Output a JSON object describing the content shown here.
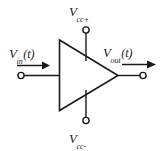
{
  "diagram": {
    "type": "circuit-schematic",
    "background_color": "#ffffff",
    "line_color": "#1a1a1a",
    "labels": {
      "input": {
        "symbol": "V",
        "subscript": "in",
        "argument": "(t)",
        "full": "V_in(t)"
      },
      "output": {
        "symbol": "V",
        "subscript": "out",
        "argument": "(t)",
        "full": "V_out(t)"
      },
      "supply_positive": {
        "symbol": "V",
        "subscript": "cc+",
        "full": "V_cc+"
      },
      "supply_negative": {
        "symbol": "V",
        "subscript": "cc-",
        "full": "V_cc-"
      }
    },
    "elements": {
      "amplifier_triangle": "triangle-amplifier",
      "input_terminal": "input-terminal-node",
      "output_terminal": "output-terminal-node",
      "supply_positive_terminal": "vcc-positive-terminal-node",
      "supply_negative_terminal": "vcc-negative-terminal-node",
      "input_arrow": "input-direction-arrow",
      "output_arrow": "output-direction-arrow"
    }
  }
}
